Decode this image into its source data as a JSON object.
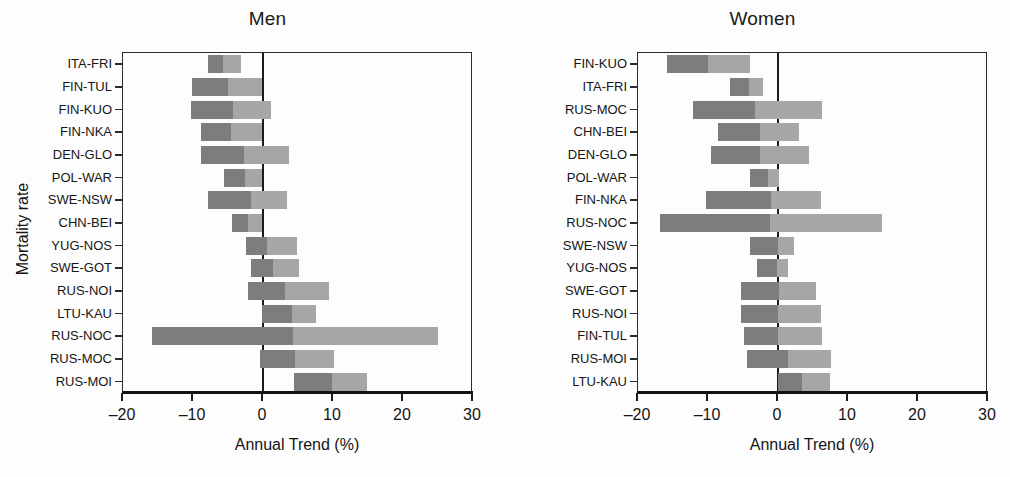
{
  "figure": {
    "xlabel": "Annual Trend (%)",
    "ylabel": "Mortality rate"
  },
  "axis": {
    "ticks": [
      "–20",
      "–10",
      "0",
      "10",
      "20",
      "30"
    ],
    "tick_values": [
      -20,
      -10,
      0,
      10,
      20,
      30
    ]
  },
  "chart_data": {
    "type": "bar",
    "orientation": "horizontal",
    "title": "",
    "xlabel": "Annual Trend (%)",
    "ylabel": "Mortality rate",
    "xlim": [
      -20,
      30
    ],
    "xticks": [
      -20,
      -10,
      0,
      10,
      20,
      30
    ],
    "grid": false,
    "legend": null,
    "note": "Each row is a floating bar (range) split into a darker left segment and a lighter right segment; values are annual trend percentages.",
    "panels": [
      {
        "name": "men",
        "title": "Men",
        "categories": [
          "ITA-FRI",
          "FIN-TUL",
          "FIN-KUO",
          "FIN-NKA",
          "DEN-GLO",
          "POL-WAR",
          "SWE-NSW",
          "CHN-BEI",
          "YUG-NOS",
          "SWE-GOT",
          "RUS-NOI",
          "LTU-KAU",
          "RUS-NOC",
          "RUS-MOC",
          "RUS-MOI"
        ],
        "bars": [
          {
            "label": "ITA-FRI",
            "start": -7.8,
            "split": -5.7,
            "end": -3.1
          },
          {
            "label": "FIN-TUL",
            "start": -10.2,
            "split": -5.0,
            "end": -0.1
          },
          {
            "label": "FIN-KUO",
            "start": -10.3,
            "split": -4.3,
            "end": 1.1
          },
          {
            "label": "FIN-NKA",
            "start": -8.9,
            "split": -4.5,
            "end": -0.2
          },
          {
            "label": "DEN-GLO",
            "start": -8.8,
            "split": -2.7,
            "end": 3.7
          },
          {
            "label": "POL-WAR",
            "start": -5.6,
            "split": -2.6,
            "end": -0.1
          },
          {
            "label": "SWE-NSW",
            "start": -7.8,
            "split": -1.7,
            "end": 3.4
          },
          {
            "label": "CHN-BEI",
            "start": -4.4,
            "split": -2.2,
            "end": -0.2
          },
          {
            "label": "YUG-NOS",
            "start": -2.4,
            "split": 0.6,
            "end": 4.8
          },
          {
            "label": "SWE-GOT",
            "start": -1.7,
            "split": 1.5,
            "end": 5.2
          },
          {
            "label": "RUS-NOI",
            "start": -2.2,
            "split": 3.1,
            "end": 9.5
          },
          {
            "label": "LTU-KAU",
            "start": -0.2,
            "split": 4.1,
            "end": 7.6
          },
          {
            "label": "RUS-NOC",
            "start": -15.8,
            "split": 4.3,
            "end": 25.0
          },
          {
            "label": "RUS-MOC",
            "start": -0.5,
            "split": 4.5,
            "end": 10.2
          },
          {
            "label": "RUS-MOI",
            "start": 4.4,
            "split": 9.9,
            "end": 14.8
          }
        ]
      },
      {
        "name": "women",
        "title": "Women",
        "categories": [
          "FIN-KUO",
          "ITA-FRI",
          "RUS-MOC",
          "CHN-BEI",
          "DEN-GLO",
          "POL-WAR",
          "FIN-NKA",
          "RUS-NOC",
          "SWE-NSW",
          "YUG-NOS",
          "SWE-GOT",
          "RUS-NOI",
          "FIN-TUL",
          "RUS-MOI",
          "LTU-KAU"
        ],
        "bars": [
          {
            "label": "FIN-KUO",
            "start": -15.8,
            "split": -10.0,
            "end": -4.0
          },
          {
            "label": "ITA-FRI",
            "start": -6.8,
            "split": -4.1,
            "end": -2.2
          },
          {
            "label": "RUS-MOC",
            "start": -12.1,
            "split": -3.3,
            "end": 6.3
          },
          {
            "label": "CHN-BEI",
            "start": -8.6,
            "split": -2.5,
            "end": 3.0
          },
          {
            "label": "DEN-GLO",
            "start": -9.6,
            "split": -2.5,
            "end": 4.5
          },
          {
            "label": "POL-WAR",
            "start": -4.0,
            "split": -1.5,
            "end": 0.2
          },
          {
            "label": "FIN-NKA",
            "start": -10.3,
            "split": -1.0,
            "end": 6.2
          },
          {
            "label": "RUS-NOC",
            "start": -16.9,
            "split": -1.1,
            "end": 14.9
          },
          {
            "label": "SWE-NSW",
            "start": -4.0,
            "split": 0.0,
            "end": 2.3
          },
          {
            "label": "YUG-NOS",
            "start": -3.0,
            "split": -0.1,
            "end": 1.5
          },
          {
            "label": "SWE-GOT",
            "start": -5.3,
            "split": 0.2,
            "end": 5.4
          },
          {
            "label": "RUS-NOI",
            "start": -5.3,
            "split": 0.0,
            "end": 6.2
          },
          {
            "label": "FIN-TUL",
            "start": -4.9,
            "split": 0.0,
            "end": 6.3
          },
          {
            "label": "RUS-MOI",
            "start": -4.5,
            "split": 1.4,
            "end": 7.6
          },
          {
            "label": "LTU-KAU",
            "start": 0.0,
            "split": 3.4,
            "end": 7.4
          }
        ]
      }
    ]
  },
  "colors": {
    "segment_dark": "#7d7d7d",
    "segment_light": "#a6a6a6",
    "axis": "#1b1b1b",
    "text": "#141414"
  }
}
